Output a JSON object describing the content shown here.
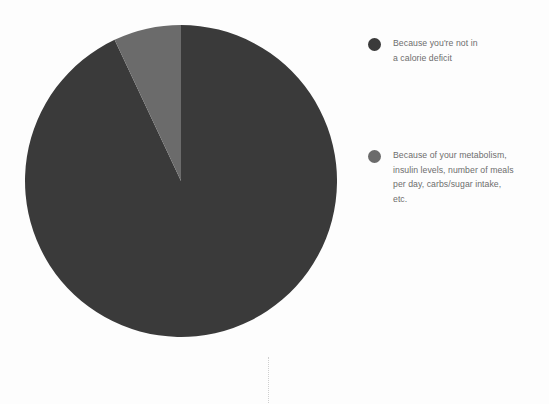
{
  "page": {
    "background_color": "#fdfdfd",
    "width": 549,
    "height": 404
  },
  "chart_data": {
    "type": "pie",
    "title": "",
    "subtitle": "",
    "xlabel": "",
    "ylabel": "",
    "grid": false,
    "legend_position": "right",
    "start_angle_deg": 0,
    "direction": "clockwise",
    "center_px": [
      181,
      181
    ],
    "radius_px": 156,
    "labels": [
      "Because you're not in a calorie deficit",
      "Because of your metabolism, insulin levels, number of meals per day, carbs/sugar intake, etc."
    ],
    "values": [
      93,
      7
    ],
    "percentages": [
      "93%",
      "7%"
    ],
    "colors": [
      "#3a3a3a",
      "#6b6b6b"
    ],
    "slices": [
      {
        "label": "Because you're not in a calorie deficit",
        "value": 93,
        "color": "#3a3a3a",
        "start_deg": 0,
        "end_deg": 334.8
      },
      {
        "label": "Because of your metabolism, insulin levels, number of meals per day, carbs/sugar intake, etc.",
        "value": 7,
        "color": "#6b6b6b",
        "start_deg": 334.8,
        "end_deg": 360
      }
    ]
  },
  "legend": {
    "entries": [
      {
        "swatch_color": "#3a3a3a",
        "label": "Because you're not in\na calorie deficit"
      },
      {
        "swatch_color": "#6b6b6b",
        "label": "Because of your metabolism,\ninsulin levels, number of meals\nper day, carbs/sugar intake,\netc."
      }
    ]
  },
  "divider": {
    "style": "dotted",
    "color": "#cfcfcf"
  }
}
